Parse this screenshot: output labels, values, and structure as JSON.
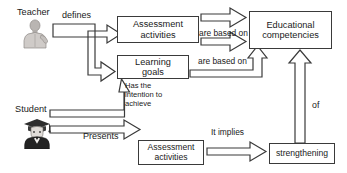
{
  "diagram": {
    "background_color": "#ffffff",
    "stroke_color": "#3a3a3a",
    "text_color": "#1a1a1a"
  },
  "actors": [
    {
      "id": "teacher",
      "label": "Teacher",
      "icon": "teacher-person-icon"
    },
    {
      "id": "student",
      "label": "Student",
      "icon": "student-graduate-person-icon"
    }
  ],
  "nodes": [
    {
      "id": "assessment_top",
      "label": "Assessment\nactivities"
    },
    {
      "id": "learning_goals",
      "label": "Learning\ngoals"
    },
    {
      "id": "competencies",
      "label": "Educational\ncompetencies"
    },
    {
      "id": "assessment_bottom",
      "label": "Assessment\nactivities"
    },
    {
      "id": "strengthening",
      "label": "strengthening"
    }
  ],
  "edges": [
    {
      "id": "defines",
      "label": "defines",
      "from": "teacher",
      "to": "assessment_top, learning_goals"
    },
    {
      "id": "based_on_top",
      "label": "are based on",
      "from": "assessment_top",
      "to": "competencies"
    },
    {
      "id": "based_on_bottom",
      "label": "are based on",
      "from": "learning_goals",
      "to": "competencies"
    },
    {
      "id": "intention",
      "label": "Has the\nintention to\nachieve",
      "from": "student",
      "to": "learning_goals"
    },
    {
      "id": "presents",
      "label": "Presents",
      "from": "student",
      "to": "assessment_bottom"
    },
    {
      "id": "it_implies",
      "label": "It implies",
      "from": "assessment_bottom",
      "to": "strengthening"
    },
    {
      "id": "of",
      "label": "of",
      "from": "strengthening",
      "to": "competencies"
    }
  ]
}
